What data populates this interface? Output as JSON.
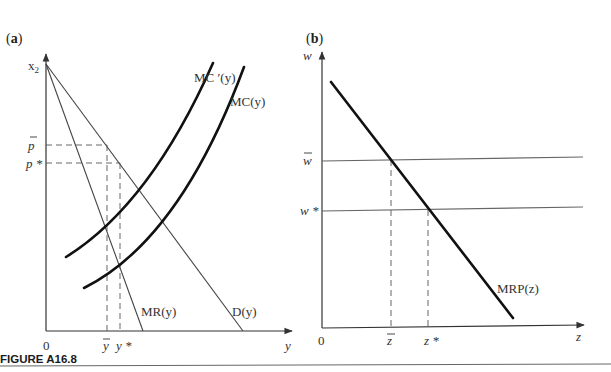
{
  "figure": {
    "caption": "FIGURE A16.8"
  },
  "panel_a": {
    "label_open": "(",
    "label": "a",
    "label_close": ")",
    "y_axis_label": "x",
    "y_axis_sub": "2",
    "x_axis_label": "y",
    "origin": "0",
    "price_labels": {
      "p_bar": "p",
      "p_star": "p *"
    },
    "quantity_labels": {
      "y_bar": "y",
      "y_star": "y *"
    },
    "curves": {
      "mc_prime": "MC ′(y)",
      "mc": "MC(y)",
      "mr": "MR(y)",
      "demand": "D(y)"
    }
  },
  "panel_b": {
    "label_open": "(",
    "label": "b",
    "label_close": ")",
    "y_axis_label": "w",
    "x_axis_label": "z",
    "origin": "0",
    "wage_labels": {
      "w_bar": "w",
      "w_star": "w *"
    },
    "quantity_labels": {
      "z_bar": "z",
      "z_star": "z *"
    },
    "curves": {
      "mrp": "MRP(z)"
    }
  },
  "colors": {
    "axis": "#333333",
    "thin_line": "#444444",
    "thick_curve": "#111111",
    "dashed": "#555555",
    "wage_lines": "#666666"
  }
}
